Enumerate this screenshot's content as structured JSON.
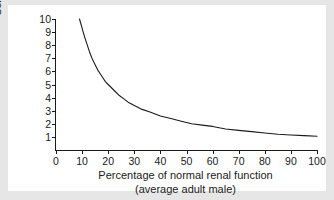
{
  "chart_data": {
    "type": "line",
    "title": "",
    "xlabel": "Percentage of normal renal function",
    "xlabel_sub": "(average adult male)",
    "ylabel": "Serum creatinine (mg/dl)",
    "xlim": [
      0,
      100
    ],
    "ylim": [
      0,
      10
    ],
    "xticks": [
      0,
      10,
      20,
      30,
      40,
      50,
      60,
      70,
      80,
      90,
      100
    ],
    "xtick_labels": [
      "0",
      "10",
      "20",
      "30",
      "40",
      "50",
      "60",
      "70",
      "80",
      "90",
      "100"
    ],
    "yticks": [
      1,
      2,
      3,
      4,
      5,
      6,
      7,
      8,
      9,
      10
    ],
    "ytick_labels": [
      "1",
      "2",
      "3",
      "4",
      "5",
      "6",
      "7",
      "8",
      "9",
      "10"
    ],
    "grid": false,
    "legend": false,
    "line_color": "#1a1a1a",
    "series": [
      {
        "name": "Serum creatinine",
        "x": [
          9,
          10,
          11,
          12,
          13,
          14,
          15,
          16,
          17,
          18,
          19,
          20,
          22,
          24,
          26,
          28,
          30,
          33,
          36,
          40,
          44,
          48,
          52,
          56,
          60,
          65,
          70,
          75,
          80,
          85,
          90,
          95,
          100
        ],
        "y": [
          10.0,
          9.3,
          8.6,
          8.0,
          7.4,
          6.9,
          6.5,
          6.1,
          5.8,
          5.5,
          5.2,
          5.0,
          4.6,
          4.2,
          3.9,
          3.6,
          3.4,
          3.1,
          2.9,
          2.6,
          2.4,
          2.2,
          2.0,
          1.9,
          1.8,
          1.6,
          1.5,
          1.4,
          1.3,
          1.2,
          1.15,
          1.1,
          1.05
        ]
      }
    ],
    "relationship_note": "Serum creatinine is inversely proportional to percentage of normal renal function"
  },
  "figure": {
    "background_color": "#e6e6e6",
    "panel_color": "#ffffff",
    "axis_color": "#1a1a1a"
  }
}
